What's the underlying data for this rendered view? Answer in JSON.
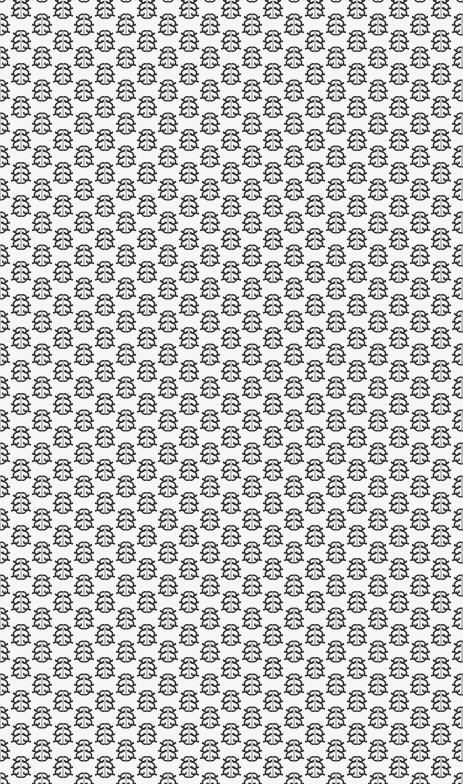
{
  "image": {
    "description": "Seamless repeating damask-style scroll motif pattern",
    "motif": "symmetric-scroll-icon",
    "colors": {
      "background": "#f6f6f6",
      "motif_dark": "#2a2a2a",
      "motif_mid": "#8a8a8a"
    },
    "tile": {
      "width": 42,
      "height": 33
    }
  }
}
